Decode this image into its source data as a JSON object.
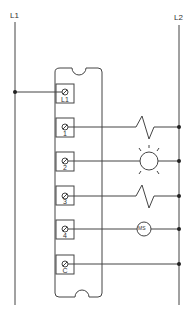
{
  "diagram": {
    "type": "wiring-schematic",
    "colors": {
      "line": "#444444",
      "background": "#ffffff"
    },
    "rails": [
      {
        "id": "L1",
        "label": "L1"
      },
      {
        "id": "L2",
        "label": "L2"
      }
    ],
    "module": {
      "terminals": [
        {
          "id": "L1",
          "label": "L1",
          "load": "none",
          "connects_to": "L1"
        },
        {
          "id": "1",
          "label": "1",
          "load": "heater",
          "connects_to": "L2"
        },
        {
          "id": "2",
          "label": "2",
          "load": "lamp",
          "connects_to": "L2"
        },
        {
          "id": "3",
          "label": "3",
          "load": "heater",
          "connects_to": "L2"
        },
        {
          "id": "4",
          "label": "4",
          "load": "motor-starter",
          "load_label": "MS",
          "connects_to": "L2"
        },
        {
          "id": "C",
          "label": "C",
          "load": "none",
          "connects_to": "L2"
        }
      ]
    }
  }
}
